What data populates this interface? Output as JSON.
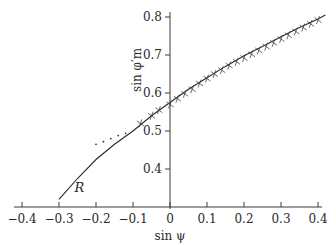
{
  "chart_data": {
    "type": "line",
    "title": "",
    "xlabel": "sin ψ",
    "ylabel": "sin φ′m",
    "xlim": [
      -0.42,
      0.42
    ],
    "ylim": [
      0.32,
      0.82
    ],
    "grid": false,
    "legend": "none",
    "x_ticks": [
      "-0.4",
      "-0.3",
      "-0.2",
      "-0.1",
      "0",
      "0.1",
      "0.2",
      "0.3",
      "0.4"
    ],
    "y_ticks": [
      "0.4",
      "0.5",
      "0.6",
      "0.7",
      "0.8"
    ],
    "annotations": [
      {
        "text": "R",
        "x": -0.25,
        "y": 0.35
      }
    ],
    "series": [
      {
        "name": "R",
        "style": "solid line",
        "x": [
          -0.3,
          -0.25,
          -0.2,
          -0.15,
          -0.1,
          -0.05,
          0.0,
          0.05,
          0.1,
          0.15,
          0.2,
          0.25,
          0.3,
          0.35,
          0.4,
          0.42
        ],
        "y": [
          0.32,
          0.375,
          0.425,
          0.465,
          0.5,
          0.54,
          0.575,
          0.61,
          0.64,
          0.67,
          0.698,
          0.722,
          0.748,
          0.772,
          0.795,
          0.805
        ]
      },
      {
        "name": "experimental points (dots)",
        "style": "scattered dots",
        "x": [
          -0.2,
          -0.18,
          -0.16,
          -0.14,
          -0.12
        ],
        "y": [
          0.465,
          0.472,
          0.48,
          0.488,
          0.494
        ]
      },
      {
        "name": "experimental points (crosses)",
        "style": "cross markers",
        "x": [
          -0.08,
          -0.05,
          -0.03,
          0.0,
          0.02,
          0.04,
          0.06,
          0.08,
          0.1,
          0.12,
          0.14,
          0.16,
          0.18,
          0.2,
          0.22,
          0.24,
          0.26,
          0.28,
          0.3,
          0.32,
          0.34,
          0.36,
          0.38,
          0.4
        ],
        "y": [
          0.52,
          0.54,
          0.555,
          0.57,
          0.585,
          0.598,
          0.61,
          0.625,
          0.638,
          0.65,
          0.66,
          0.672,
          0.682,
          0.692,
          0.702,
          0.712,
          0.722,
          0.732,
          0.742,
          0.752,
          0.762,
          0.772,
          0.782,
          0.792
        ]
      }
    ]
  }
}
